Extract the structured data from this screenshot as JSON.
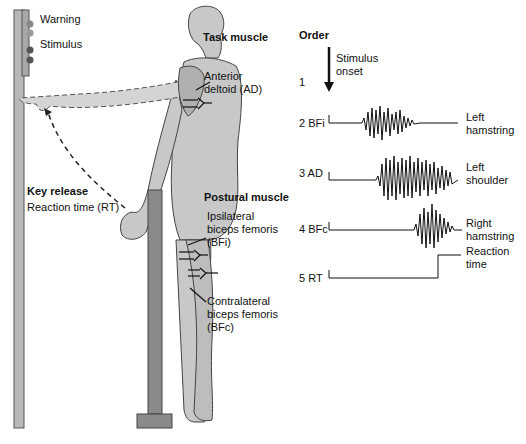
{
  "figure": {
    "signal_panel": {
      "warning_label": "Warning",
      "stimulus_label": "Stimulus"
    },
    "key_release": {
      "title": "Key release",
      "subtitle": "Reaction time (RT)"
    },
    "task_muscle": {
      "title": "Task muscle",
      "muscle_line1": "Anterior",
      "muscle_line2": "deltoid (AD)"
    },
    "postural_muscle": {
      "title": "Postural muscle",
      "ipsi_line1": "Ipsilateral",
      "ipsi_line2": "biceps femoris",
      "ipsi_line3": "(BFi)",
      "contra_line1": "Contralateral",
      "contra_line2": "biceps femoris",
      "contra_line3": "(BFc)"
    },
    "order": {
      "title": "Order",
      "stimulus_line1": "Stimulus",
      "stimulus_line2": "onset",
      "rows": [
        {
          "index": "1",
          "code": "",
          "label_line1": "",
          "label_line2": ""
        },
        {
          "index": "2",
          "code": "BFi",
          "label_line1": "Left",
          "label_line2": "hamstring"
        },
        {
          "index": "3",
          "code": "AD",
          "label_line1": "Left",
          "label_line2": "shoulder"
        },
        {
          "index": "4",
          "code": "BFc",
          "label_line1": "Right",
          "label_line2": "hamstring"
        },
        {
          "index": "5",
          "code": "RT",
          "label_line1": "Reaction",
          "label_line2": "time"
        }
      ]
    },
    "colors": {
      "body_fill": "#c8c8c8",
      "body_stroke": "#444444",
      "post_fill": "#8a8a8a",
      "panel_fill": "#b5b5b5",
      "trace": "#111111"
    }
  }
}
